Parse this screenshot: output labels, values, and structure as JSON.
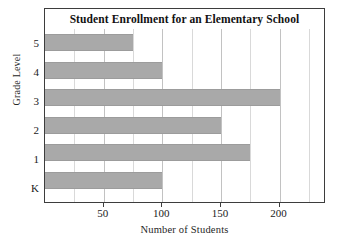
{
  "chart_data": {
    "type": "bar",
    "orientation": "horizontal",
    "title": "Student Enrollment for an Elementary School",
    "xlabel": "Number of Students",
    "ylabel": "Grade Level",
    "categories": [
      "K",
      "1",
      "2",
      "3",
      "4",
      "5"
    ],
    "values": [
      100,
      175,
      150,
      200,
      100,
      75
    ],
    "bars": [
      {
        "category": "5",
        "value": 75
      },
      {
        "category": "4",
        "value": 100
      },
      {
        "category": "3",
        "value": 200
      },
      {
        "category": "2",
        "value": 150
      },
      {
        "category": "1",
        "value": 175
      },
      {
        "category": "K",
        "value": 100
      }
    ],
    "xlim": [
      0,
      237
    ],
    "ylim_categories_top_to_bottom": [
      "5",
      "4",
      "3",
      "2",
      "1",
      "K"
    ],
    "xticks": [
      50,
      100,
      150,
      200
    ],
    "xtick_labels": [
      "50",
      "100",
      "150",
      "200"
    ],
    "gridline_step": 25,
    "grid": true,
    "legend": null,
    "bar_color": "#a9a9a9",
    "frame_color": "#3d3d3d",
    "grid_color": "#d9d9d9"
  }
}
